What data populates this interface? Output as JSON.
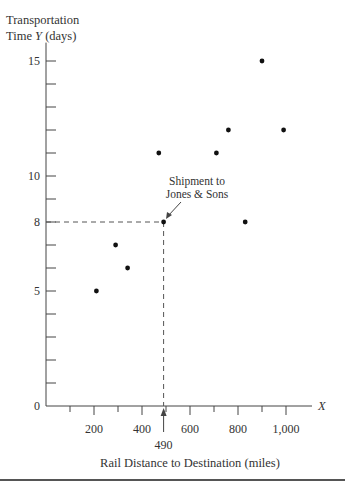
{
  "chart_data": {
    "type": "scatter",
    "title": "",
    "ylabel_line1": "Transportation",
    "ylabel_line2_pre": "Time ",
    "ylabel_var": "Y",
    "ylabel_line2_post": " (days)",
    "xlabel": "Rail Distance to Destination (miles)",
    "x_axis_var": "X",
    "xlim": [
      0,
      1150
    ],
    "ylim": [
      0,
      16
    ],
    "x_ticks_major": [
      200,
      400,
      600,
      800,
      1000
    ],
    "x_tick_labels": [
      "200",
      "400",
      "600",
      "800",
      "1,000"
    ],
    "x_ticks_minor": [
      100,
      300,
      500,
      700,
      900
    ],
    "y_ticks": [
      1,
      2,
      3,
      4,
      5,
      6,
      7,
      8,
      9,
      10,
      11,
      12,
      13,
      14,
      15
    ],
    "y_tick_labels": {
      "0": "0",
      "5": "5",
      "8": "8",
      "10": "10",
      "15": "15"
    },
    "grid": false,
    "points": [
      {
        "x": 210,
        "y": 5
      },
      {
        "x": 290,
        "y": 7
      },
      {
        "x": 340,
        "y": 6
      },
      {
        "x": 470,
        "y": 11
      },
      {
        "x": 490,
        "y": 8
      },
      {
        "x": 710,
        "y": 11
      },
      {
        "x": 760,
        "y": 12
      },
      {
        "x": 830,
        "y": 8
      },
      {
        "x": 900,
        "y": 15
      },
      {
        "x": 990,
        "y": 12
      }
    ],
    "highlight": {
      "x": 490,
      "y": 8,
      "label_line1": "Shipment to",
      "label_line2": "Jones & Sons",
      "x_marker_label": "490"
    }
  }
}
